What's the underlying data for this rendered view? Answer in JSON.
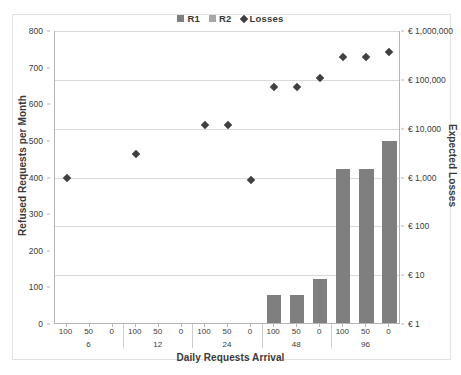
{
  "chart_data": {
    "type": "bar",
    "title": "",
    "xlabel": "Daily Requests Arrival",
    "ylabel": "Refused Requests per Month",
    "y2label": "Expected Losses",
    "grid": true,
    "legend_position": "top-center",
    "legend": [
      {
        "name": "R1",
        "type": "bar",
        "color": "#7f7f7f"
      },
      {
        "name": "R2",
        "type": "bar",
        "color": "#a6a6a6"
      },
      {
        "name": "Losses",
        "type": "scatter",
        "color": "#404040"
      }
    ],
    "x_groups": [
      "6",
      "12",
      "24",
      "48",
      "96"
    ],
    "x_subticks": [
      "100",
      "50",
      "0"
    ],
    "categories": [
      "6/100",
      "6/50",
      "6/0",
      "12/100",
      "12/50",
      "12/0",
      "24/100",
      "24/50",
      "24/0",
      "48/100",
      "48/50",
      "48/0",
      "96/100",
      "96/50",
      "96/0"
    ],
    "ylim": [
      0,
      800
    ],
    "yticks": [
      0,
      100,
      200,
      300,
      400,
      500,
      600,
      700,
      800
    ],
    "ytick_labels": [
      "0",
      "100",
      "200",
      "300",
      "400",
      "500",
      "600",
      "700",
      "800"
    ],
    "y2_scale": "log",
    "y2lim": [
      1,
      1000000
    ],
    "y2ticks": [
      1,
      10,
      100,
      1000,
      10000,
      100000,
      1000000
    ],
    "y2tick_labels": [
      "€ 1",
      "€ 10",
      "€ 100",
      "€ 1,000",
      "€ 10,000",
      "€ 100,000",
      "€ 1,000,000"
    ],
    "series": [
      {
        "name": "R1",
        "type": "bar",
        "axis": "left",
        "color": "#7f7f7f",
        "values": [
          0,
          0,
          0,
          0,
          0,
          0,
          0,
          0,
          0,
          77,
          77,
          120,
          420,
          420,
          497
        ]
      },
      {
        "name": "R2",
        "type": "bar",
        "axis": "left",
        "color": "#a6a6a6",
        "values": [
          0,
          0,
          0,
          0,
          0,
          0,
          0,
          0,
          0,
          0,
          0,
          0,
          0,
          0,
          0
        ]
      },
      {
        "name": "Losses",
        "type": "scatter",
        "axis": "right",
        "color": "#404040",
        "values": [
          1000,
          0,
          0,
          3000,
          0,
          0,
          12000,
          12000,
          900,
          70000,
          70000,
          110000,
          300000,
          300000,
          380000
        ]
      }
    ]
  },
  "legend": {
    "r1": "R1",
    "r2": "R2",
    "losses": "Losses"
  },
  "axes": {
    "left_title": "Refused Requests per Month",
    "right_title": "Expected Losses",
    "x_title": "Daily Requests Arrival"
  }
}
